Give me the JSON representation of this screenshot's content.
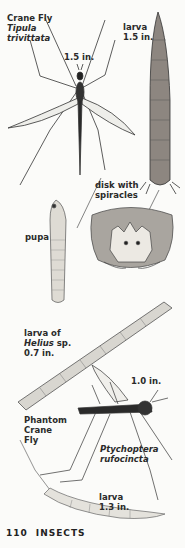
{
  "page": {
    "number": "110",
    "section": "INSECTS"
  },
  "labels": {
    "crane_fly": {
      "common": "Crane Fly",
      "genus": "Tipula",
      "species": "trivittata",
      "size": "1.5 in."
    },
    "crane_fly_larva": {
      "stage": "larva",
      "size": "1.5 in."
    },
    "disk": {
      "line1": "disk with",
      "line2": "spiracles"
    },
    "pupa": {
      "stage": "pupa"
    },
    "helius_larva": {
      "line1": "larva of",
      "genus": "Helius",
      "suffix": "sp.",
      "size": "0.7 in."
    },
    "phantom": {
      "line1": "Phantom",
      "line2": "Crane",
      "line3": "Fly",
      "size": "1.0 in."
    },
    "ptychoptera": {
      "genus": "Ptychoptera",
      "species": "rufocincta"
    },
    "phantom_larva": {
      "stage": "larva",
      "size": "1.3 in."
    }
  },
  "colors": {
    "background": "#fbfbf9",
    "ink": "#2a2a2a",
    "larva_fill": "#c9c4bc",
    "pale_fill": "#e4e2dc"
  }
}
